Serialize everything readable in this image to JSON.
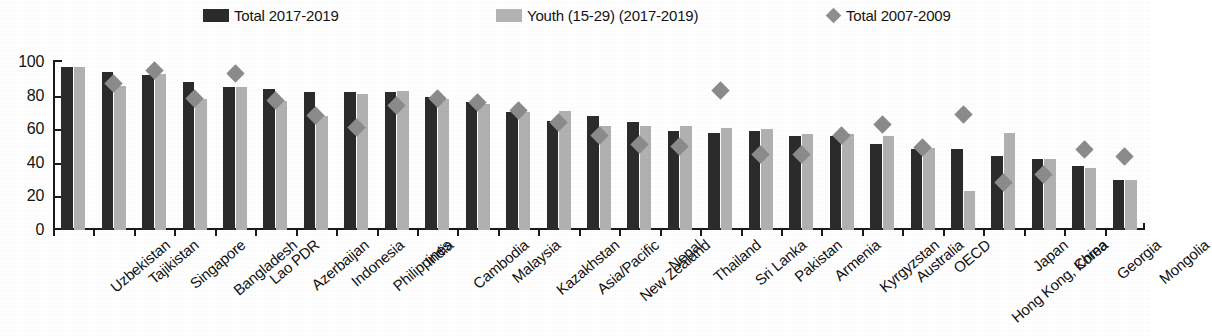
{
  "legend": {
    "items": [
      {
        "label": "Total 2017-2019",
        "marker": "dark-square-swatch",
        "color": "#2b2b2b"
      },
      {
        "label": "Youth (15-29) (2017-2019)",
        "marker": "light-square-swatch",
        "color": "#b4b4b4"
      },
      {
        "label": "Total 2007-2009",
        "marker": "gray-diamond-marker",
        "color": "#8f8f8f"
      }
    ]
  },
  "chart_data": {
    "type": "bar",
    "title": "",
    "subtitle": "",
    "xlabel": "",
    "ylabel": "",
    "ylim": [
      0,
      100
    ],
    "yticks": [
      0,
      20,
      40,
      60,
      80,
      100
    ],
    "grid": false,
    "legend_position": "top",
    "categories": [
      "Uzbekistan",
      "Tajikistan",
      "Singapore",
      "Bangladesh",
      "Lao PDR",
      "Azerbaijan",
      "Indonesia",
      "Philippines",
      "India",
      "Cambodia",
      "Malaysia",
      "Kazakhstan",
      "Asia/Pacific",
      "New Zealand",
      "Nepal",
      "Thailand",
      "Sri Lanka",
      "Pakistan",
      "Armenia",
      "Kyrgyzstan",
      "Australia",
      "OECD",
      "Hong Kong, China",
      "Japan",
      "Korea",
      "Georgia",
      "Mongolia"
    ],
    "series": [
      {
        "name": "Total 2017-2019",
        "color": "#2b2b2b",
        "values": [
          97,
          94,
          92,
          88,
          85,
          84,
          82,
          82,
          82,
          79,
          76,
          70,
          65,
          68,
          64,
          59,
          58,
          59,
          56,
          56,
          51,
          48,
          48,
          44,
          42,
          38,
          30
        ]
      },
      {
        "name": "Youth (15-29) (2017-2019)",
        "color": "#b1b1b1",
        "values": [
          97,
          86,
          93,
          78,
          85,
          77,
          68,
          81,
          83,
          78,
          75,
          70,
          71,
          62,
          62,
          62,
          61,
          60,
          57,
          57,
          56,
          49,
          23,
          58,
          42,
          37,
          30
        ]
      }
    ],
    "marker_series": {
      "name": "Total 2007-2009",
      "color": "#8b8b8b",
      "shape": "diamond",
      "values": [
        null,
        87,
        95,
        78,
        93,
        77,
        68,
        61,
        74,
        78,
        76,
        71,
        64,
        56,
        51,
        50,
        83,
        45,
        45,
        56,
        63,
        49,
        69,
        28,
        33,
        48,
        44
      ]
    }
  }
}
